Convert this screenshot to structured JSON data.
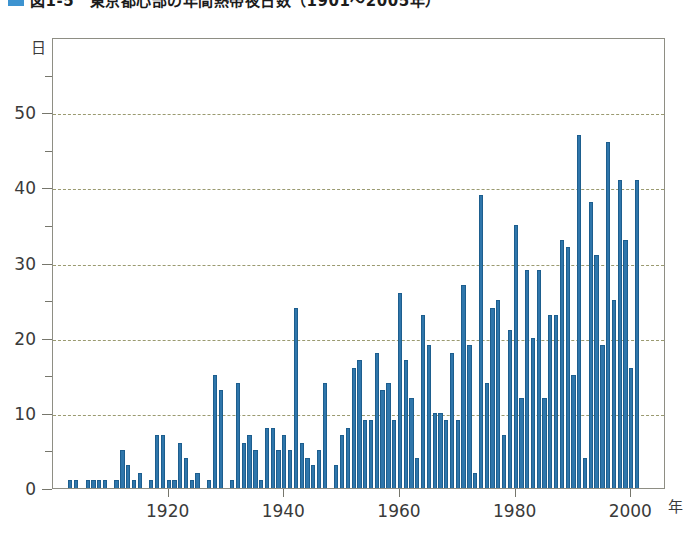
{
  "caption": {
    "marker": "blue-square-marker",
    "text": "図1-5　東京都心部の年間熱帯夜日数（1901～2005年）"
  },
  "axes": {
    "y_unit": "日",
    "x_unit": "年",
    "y_labels": [
      "0",
      "10",
      "20",
      "30",
      "40",
      "50"
    ],
    "x_labels": [
      "1920",
      "1940",
      "1960",
      "1980",
      "2000"
    ]
  },
  "chart_data": {
    "type": "bar",
    "title": "図1-5　東京都心部の年間熱帯夜日数（1901～2005年）",
    "xlabel": "年",
    "ylabel": "日",
    "ylim": [
      0,
      60
    ],
    "xlim": [
      1900,
      2006
    ],
    "grid": true,
    "gridlines_y": [
      10,
      20,
      30,
      40,
      50
    ],
    "y_major_ticks": [
      0,
      10,
      20,
      30,
      40,
      50
    ],
    "y_minor_ticks": [
      5,
      15,
      25,
      35,
      45,
      55
    ],
    "x_major_ticks": [
      1920,
      1940,
      1960,
      1980,
      2000
    ],
    "legend": null,
    "bar_color": "#2f76ab",
    "bar_edge_color": "#1d5e8e",
    "grid_color": "#9a9a70",
    "frame_color": "#8e8e84",
    "categories": [
      1901,
      1902,
      1903,
      1904,
      1905,
      1906,
      1907,
      1908,
      1909,
      1910,
      1911,
      1912,
      1913,
      1914,
      1915,
      1916,
      1917,
      1918,
      1919,
      1920,
      1921,
      1922,
      1923,
      1924,
      1925,
      1926,
      1927,
      1928,
      1929,
      1930,
      1931,
      1932,
      1933,
      1934,
      1935,
      1936,
      1937,
      1938,
      1939,
      1940,
      1941,
      1942,
      1943,
      1944,
      1945,
      1946,
      1947,
      1948,
      1949,
      1950,
      1951,
      1952,
      1953,
      1954,
      1955,
      1956,
      1957,
      1958,
      1959,
      1960,
      1961,
      1962,
      1963,
      1964,
      1965,
      1966,
      1967,
      1968,
      1969,
      1970,
      1971,
      1972,
      1973,
      1974,
      1975,
      1976,
      1977,
      1978,
      1979,
      1980,
      1981,
      1982,
      1983,
      1984,
      1985,
      1986,
      1987,
      1988,
      1989,
      1990,
      1991,
      1992,
      1993,
      1994,
      1995,
      1996,
      1997,
      1998,
      1999,
      2000,
      2001,
      2002,
      2003,
      2004,
      2005
    ],
    "values": [
      0,
      0,
      1,
      1,
      0,
      1,
      1,
      1,
      1,
      0,
      1,
      5,
      3,
      1,
      2,
      0,
      1,
      7,
      7,
      1,
      1,
      6,
      4,
      1,
      2,
      0,
      1,
      15,
      13,
      0,
      1,
      14,
      6,
      7,
      5,
      1,
      8,
      8,
      5,
      7,
      5,
      24,
      6,
      4,
      3,
      5,
      14,
      0,
      3,
      7,
      8,
      16,
      17,
      9,
      9,
      18,
      13,
      14,
      9,
      26,
      17,
      12,
      4,
      23,
      19,
      10,
      10,
      9,
      18,
      9,
      27,
      19,
      2,
      39,
      14,
      24,
      25,
      7,
      21,
      35,
      12,
      29,
      20,
      29,
      12,
      23,
      23,
      33,
      32,
      15,
      47,
      4,
      38,
      31,
      19,
      46,
      25,
      41,
      33,
      16,
      41,
      0,
      0,
      0,
      0
    ]
  }
}
